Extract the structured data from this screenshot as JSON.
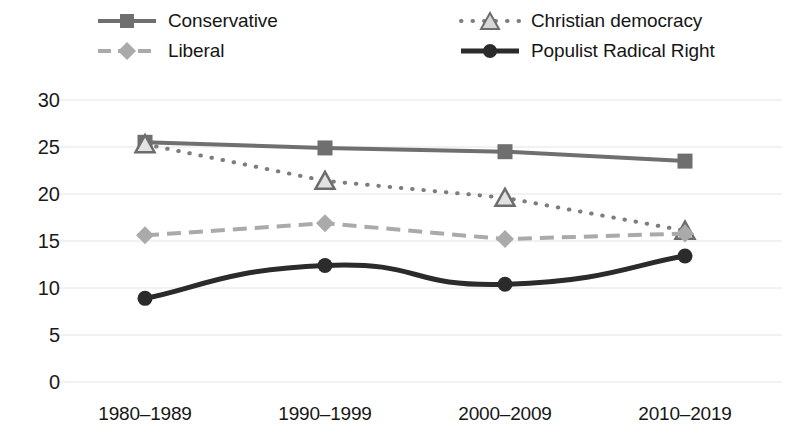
{
  "chart_data": {
    "type": "line",
    "title": "",
    "subtitle": "",
    "xlabel": "",
    "ylabel": "",
    "categories": [
      "1980–1989",
      "1990–1999",
      "2000–2009",
      "2010–2019"
    ],
    "ylim": [
      0,
      30
    ],
    "yticks": [
      0,
      5,
      10,
      15,
      20,
      25,
      30
    ],
    "ytick_labels": [
      "0",
      "5",
      "10",
      "15",
      "20",
      "25",
      "30"
    ],
    "grid": true,
    "grid_axis": "y",
    "legend_position": "top",
    "series": [
      {
        "name": "Conservative",
        "values": [
          25.5,
          24.9,
          24.5,
          23.5
        ],
        "color": "#6f6f6f",
        "marker": "square",
        "linestyle": "solid",
        "linewidth": 4
      },
      {
        "name": "Christian democracy",
        "values": [
          25.3,
          21.4,
          19.6,
          16.1
        ],
        "color": "#7d7d7d",
        "marker": "triangle",
        "linestyle": "dotted",
        "linewidth": 4
      },
      {
        "name": "Liberal",
        "values": [
          15.6,
          16.9,
          15.2,
          15.8
        ],
        "color": "#aaaaaa",
        "marker": "diamond",
        "linestyle": "dashed",
        "linewidth": 4
      },
      {
        "name": "Populist Radical Right",
        "values": [
          8.9,
          12.4,
          10.4,
          13.4
        ],
        "color": "#2b2b2b",
        "marker": "circle",
        "linestyle": "solid",
        "linewidth": 5
      }
    ]
  },
  "legend": {
    "items": [
      {
        "label": "Conservative",
        "icon": "square-marker-solid-line-icon"
      },
      {
        "label": "Liberal",
        "icon": "diamond-marker-dashed-line-icon"
      },
      {
        "label": "Christian democracy",
        "icon": "triangle-marker-dotted-line-icon"
      },
      {
        "label": "Populist Radical Right",
        "icon": "circle-marker-solid-line-icon"
      }
    ]
  },
  "colors": {
    "background": "#ffffff",
    "gridline": "#e4e4e4",
    "text": "#161616",
    "conservative": "#6f6f6f",
    "christian_democracy": "#7d7d7d",
    "liberal": "#aaaaaa",
    "populist_radical_right": "#2b2b2b"
  }
}
